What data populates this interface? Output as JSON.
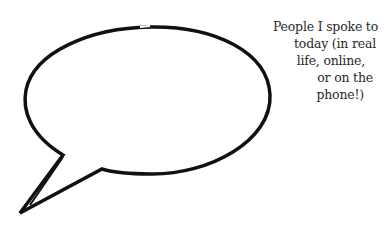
{
  "caption": {
    "lines": [
      "People I spoke to",
      "today (in real",
      "life, online,",
      "or on the",
      "phone!)"
    ]
  },
  "colors": {
    "stroke": "#111111",
    "text": "#2a2a2a",
    "background": "#ffffff"
  }
}
